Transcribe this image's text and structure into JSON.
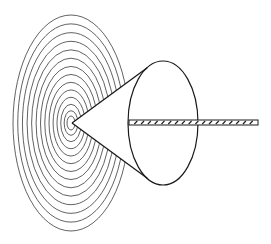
{
  "figure": {
    "title": "",
    "colors": {
      "stroke": "#1a1a1a",
      "rings": "#3a3a3a",
      "background": "#ffffff"
    },
    "rings": {
      "center": [
        71,
        123
      ],
      "count": 14,
      "outer_rx": 58,
      "outer_ry": 108,
      "inner_rx": 4,
      "inner_ry": 7
    },
    "cone": {
      "apex": [
        72,
        123
      ],
      "base_center": [
        163,
        123
      ],
      "base_rx": 35,
      "base_ry": 62
    },
    "rod": {
      "x_start": 129,
      "x_end": 258,
      "y_top": 120,
      "y_bottom": 125,
      "hatch_count": 18
    }
  }
}
